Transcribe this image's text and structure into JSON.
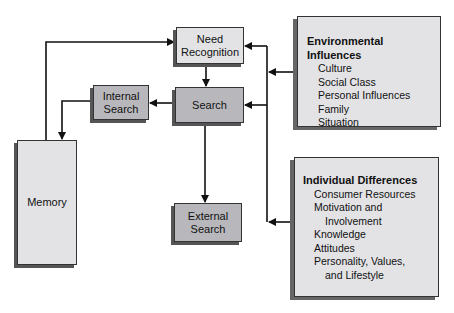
{
  "nodes": {
    "need_recognition": {
      "label_line1": "Need",
      "label_line2": "Recognition"
    },
    "search": {
      "label": "Search"
    },
    "internal_search": {
      "label_line1": "Internal",
      "label_line2": "Search"
    },
    "external_search": {
      "label_line1": "External",
      "label_line2": "Search"
    },
    "memory": {
      "label": "Memory"
    }
  },
  "environmental_influences": {
    "title": "Environmental Influences",
    "items": [
      "Culture",
      "Social Class",
      "Personal Influences",
      "Family",
      "Situation"
    ]
  },
  "individual_differences": {
    "title": "Individual Differences",
    "items": [
      "Consumer Resources",
      "Motivation and",
      "Involvement",
      "Knowledge",
      "Attitudes",
      "Personality, Values,",
      "and Lifestyle"
    ]
  },
  "colors": {
    "light_box": "#e3e3e6",
    "dark_box": "#b8b8bc",
    "line": "#111111"
  }
}
